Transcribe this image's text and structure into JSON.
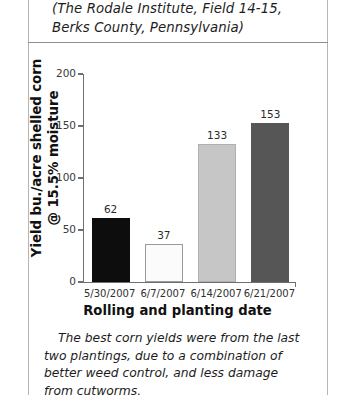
{
  "header": {
    "line1": "(The Rodale Institute, Field 14-15,",
    "line2": "Berks County, Pennsylvania)"
  },
  "axis_titles": {
    "y_line1": "Yield bu./acre shelled corn",
    "y_line2": "@ 15.5% moisture",
    "x": "Rolling and planting date"
  },
  "caption": {
    "line1": "The best corn yields were from the last two",
    "line2": "plantings, due to a combination of better weed",
    "line3": "control, and less damage from cutworms."
  },
  "chart_data": {
    "type": "bar",
    "title": "(The Rodale Institute, Field 14-15, Berks County, Pennsylvania)",
    "xlabel": "Rolling and planting date",
    "ylabel": "Yield bu./acre shelled corn @ 15.5% moisture",
    "categories": [
      "5/30/2007",
      "6/7/2007",
      "6/14/2007",
      "6/21/2007"
    ],
    "values": [
      62,
      37,
      133,
      153
    ],
    "value_labels": [
      "62",
      "37",
      "133",
      "153"
    ],
    "bar_colors": [
      "#0d0d0d",
      "#fbfbfb",
      "#c6c6c6",
      "#565656"
    ],
    "bar_border_colors": [
      "#0d0d0d",
      "#9a9a9a",
      "#b0b0b0",
      "#565656"
    ],
    "ylim": [
      0,
      200
    ],
    "yticks": [
      0,
      50,
      100,
      150,
      200
    ],
    "ytick_labels": [
      "0",
      "50",
      "100",
      "150",
      "200"
    ],
    "grid": false,
    "legend": false
  }
}
